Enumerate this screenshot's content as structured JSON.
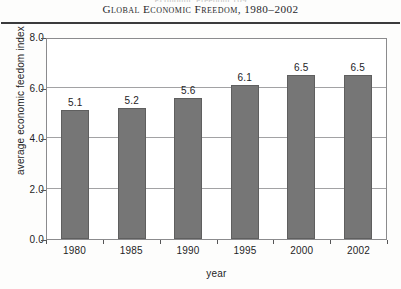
{
  "figure": {
    "title": "Global Economic Freedom, 1980–2002",
    "scan_remnant": "Economic Freedom  109"
  },
  "chart_data": {
    "type": "bar",
    "title": "Global Economic Freedom, 1980–2002",
    "categories": [
      "1980",
      "1985",
      "1990",
      "1995",
      "2000",
      "2002"
    ],
    "values": [
      5.1,
      5.2,
      5.6,
      6.1,
      6.5,
      6.5
    ],
    "value_labels": [
      "5.1",
      "5.2",
      "5.6",
      "6.1",
      "6.5",
      "6.5"
    ],
    "xlabel": "year",
    "ylabel": "average economic feedom index",
    "ylim": [
      0.0,
      8.0
    ],
    "ytick_labels": [
      "0.0",
      "2.0",
      "4.0",
      "6.0",
      "8.0"
    ],
    "ytick_values": [
      0.0,
      2.0,
      4.0,
      6.0,
      8.0
    ],
    "grid": true,
    "gridline_values": [
      2.0,
      4.0,
      6.0
    ],
    "legend": null,
    "bar_color": "#767676",
    "bar_edge_color": "#5f5f5f",
    "frame_color": "#8b8b8d",
    "text_color": "#1d1d1f"
  }
}
